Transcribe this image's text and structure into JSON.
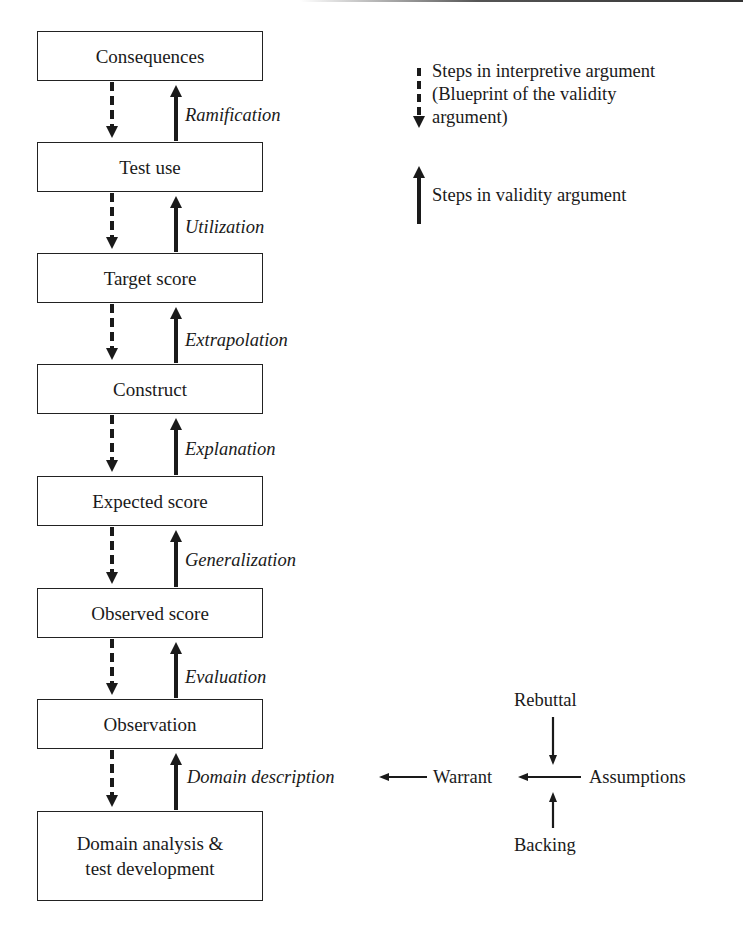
{
  "diagram": {
    "boxes": [
      {
        "label": "Consequences"
      },
      {
        "label": "Test use"
      },
      {
        "label": "Target score"
      },
      {
        "label": "Construct"
      },
      {
        "label": "Expected score"
      },
      {
        "label": "Observed score"
      },
      {
        "label": "Observation"
      },
      {
        "label_line1": "Domain analysis &",
        "label_line2": "test development"
      }
    ],
    "inferences": [
      {
        "label": "Ramification"
      },
      {
        "label": "Utilization"
      },
      {
        "label": "Extrapolation"
      },
      {
        "label": "Explanation"
      },
      {
        "label": "Generalization"
      },
      {
        "label": "Evaluation"
      },
      {
        "label": "Domain description"
      }
    ],
    "legend": {
      "dashed_arrow": {
        "line1": "Steps in interpretive argument",
        "line2": "(Blueprint of the validity",
        "line3": "argument)"
      },
      "solid_arrow": {
        "label": "Steps in validity argument"
      }
    },
    "toulmin": {
      "rebuttal": "Rebuttal",
      "warrant": "Warrant",
      "assumptions": "Assumptions",
      "backing": "Backing"
    },
    "colors": {
      "stroke": "#1a1a1a",
      "background": "#ffffff"
    }
  }
}
